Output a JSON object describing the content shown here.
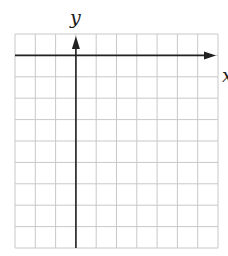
{
  "chart_data": {
    "type": "coordinate-grid",
    "title": "",
    "xlabel": "x",
    "ylabel": "y",
    "grid": {
      "columns": 10,
      "rows": 10,
      "left": 15,
      "top": 34,
      "right": 218,
      "bottom": 248,
      "line_color": "#c8c8c8"
    },
    "axes": {
      "y_axis_column_index": 3,
      "x_axis_row_index": 1,
      "axis_color": "#222222",
      "x_arrow": "right",
      "y_arrow": "up"
    },
    "data_points": [],
    "tick_labels": []
  },
  "labels": {
    "x_axis": "x",
    "y_axis": "y"
  }
}
